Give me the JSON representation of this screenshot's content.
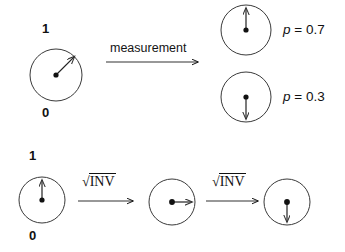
{
  "figure": {
    "background_color": "#ffffff",
    "stroke_color": "#111111",
    "width": 345,
    "height": 252
  },
  "top_row": {
    "source_qubit": {
      "label_top": "1",
      "label_bottom": "0",
      "state_vector_angle_deg": 45,
      "center": {
        "x": 56,
        "y": 75
      },
      "radius": 26
    },
    "operation": {
      "label": "measurement",
      "arrow": "right-arrow"
    },
    "outcomes": [
      {
        "name": "outcome-one",
        "vector_direction": "up",
        "probability_label": "p = 0.7",
        "probability_symbol": "p",
        "probability_value": "= 0.7",
        "center": {
          "x": 246,
          "y": 30
        },
        "radius": 25
      },
      {
        "name": "outcome-zero",
        "vector_direction": "down",
        "probability_label": "p = 0.3",
        "probability_symbol": "p",
        "probability_value": "= 0.3",
        "center": {
          "x": 246,
          "y": 97
        },
        "radius": 25
      }
    ]
  },
  "bottom_row": {
    "start_qubit": {
      "label_top": "1",
      "label_bottom": "0",
      "vector_direction": "up",
      "center": {
        "x": 42,
        "y": 200
      },
      "radius": 23
    },
    "gates": [
      {
        "name": "sqrt-inv-gate-1",
        "radical": "√",
        "radicand": "INV",
        "arrow": "right-arrow"
      },
      {
        "name": "sqrt-inv-gate-2",
        "radical": "√",
        "radicand": "INV",
        "arrow": "right-arrow"
      }
    ],
    "intermediate_qubit": {
      "vector_direction": "right",
      "center": {
        "x": 172,
        "y": 202
      },
      "radius": 23
    },
    "final_qubit": {
      "vector_direction": "down",
      "center": {
        "x": 287,
        "y": 202
      },
      "radius": 23
    }
  }
}
